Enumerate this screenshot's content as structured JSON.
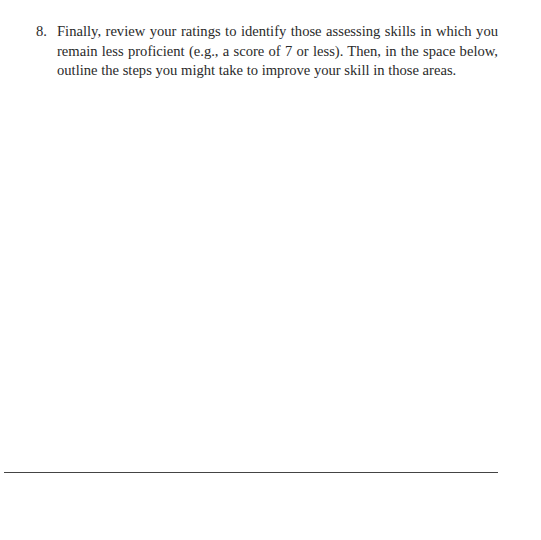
{
  "document": {
    "items": [
      {
        "number": "8.",
        "text": "Finally, review your ratings to identify those assessing skills in which you remain less proficient (e.g., a score of 7 or less). Then, in the space below, outline the steps you might take to improve your skill in those areas."
      }
    ],
    "colors": {
      "text": "#2a2a2a",
      "rule": "#444444",
      "background": "#ffffff"
    }
  }
}
